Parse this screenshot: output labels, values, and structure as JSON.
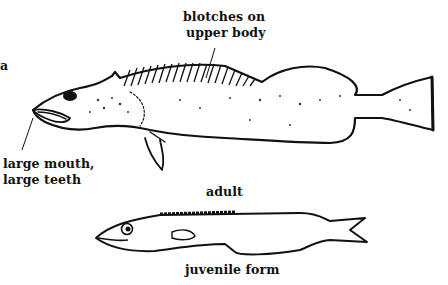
{
  "labels": {
    "blotches": [
      "blotches on",
      "upper body"
    ],
    "mouth": [
      "large mouth,",
      "large teeth"
    ],
    "adult": "adult",
    "juvenile": "juvenile form",
    "edge_fragment": "a"
  },
  "figures": {
    "adult_fish": "adult fish illustration with blotched upper body, spiny dorsal fin, large mouth and teeth",
    "juvenile_fish": "juvenile form illustration, elongate body with forked tail"
  }
}
